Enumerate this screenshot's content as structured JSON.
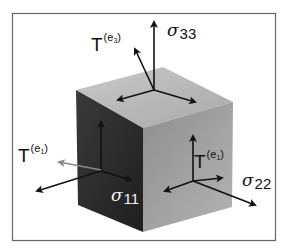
{
  "diagram": {
    "colors": {
      "frame": "#666666",
      "top_face": "#b8b8b8",
      "left_face": "#2e2e2e",
      "right_face": "#9c9c9c",
      "arrow": "#111111",
      "traction_arrow_left": "#8a8a8a",
      "label_on_dark": "#f0f0f0"
    },
    "labels": {
      "t_e3": {
        "base": "T",
        "sup_open": "(e",
        "sup_sub": "3",
        "sup_close": ")"
      },
      "sigma33": {
        "sym": "σ",
        "sub": "33"
      },
      "t_e1_left": {
        "base": "T",
        "sup_open": "(e",
        "sup_sub": "1",
        "sup_close": ")"
      },
      "t_e1_right": {
        "base": "T",
        "sup_open": "(e",
        "sup_sub": "1",
        "sup_close": ")"
      },
      "sigma11": {
        "sym": "σ",
        "sub": "11"
      },
      "sigma22": {
        "sym": "σ",
        "sub": "22"
      }
    }
  }
}
